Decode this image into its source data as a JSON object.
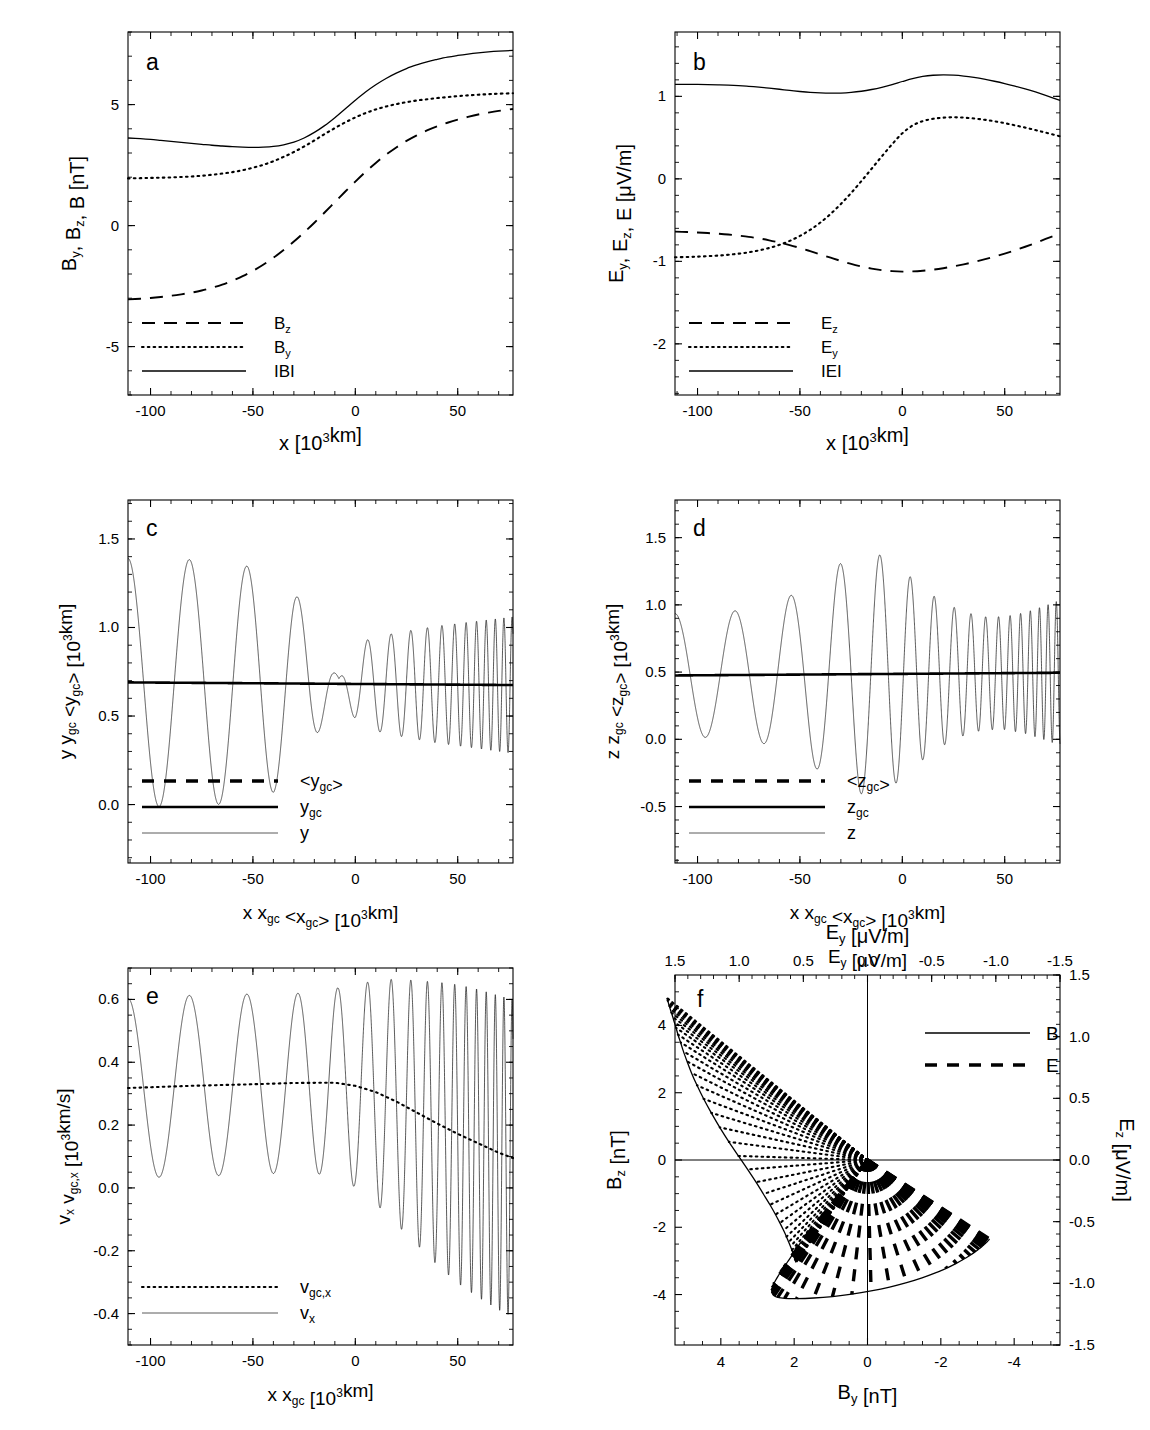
{
  "figure": {
    "title": "",
    "panels": [
      "a",
      "b",
      "c",
      "d",
      "e",
      "f"
    ]
  },
  "chart_data": [
    {
      "id": "a",
      "type": "line",
      "panel_label": "a",
      "title": "",
      "xlabel": "x  [10³km]",
      "ylabel": "Bᵧ, Bᶻ, B  [nT]",
      "xlabel_parts": {
        "main": "x",
        "unit_open": "[10",
        "sup": "3",
        "unit_close": "km]"
      },
      "ylabel_parts": [
        {
          "t": "B",
          "sub": "y"
        },
        {
          "t": ", B",
          "sub": "z"
        },
        {
          "t": ", B  [nT]",
          "sub": ""
        }
      ],
      "xlim": [
        -111,
        77
      ],
      "ylim": [
        -7.0,
        8.0
      ],
      "xticks": [
        -100,
        -50,
        0,
        50
      ],
      "xticklabels": [
        "-100",
        "-50",
        "0",
        "50"
      ],
      "yticks": [
        5,
        0,
        -5
      ],
      "yticklabels": [
        "5",
        "0",
        "-5"
      ],
      "xminor_step": 10,
      "yminor_step": 1,
      "grid": false,
      "legend_position": "lower-left",
      "legend": [
        {
          "label": "B",
          "sub": "z",
          "style": "dashed"
        },
        {
          "label": "B",
          "sub": "y",
          "style": "dotted"
        },
        {
          "label": "IBI",
          "sub": "",
          "style": "solid"
        }
      ],
      "x": [
        -111,
        -105,
        -100,
        -95,
        -90,
        -85,
        -80,
        -75,
        -70,
        -65,
        -60,
        -55,
        -50,
        -45,
        -40,
        -35,
        -30,
        -25,
        -20,
        -15,
        -10,
        -5,
        0,
        5,
        10,
        15,
        20,
        25,
        30,
        35,
        40,
        45,
        50,
        55,
        60,
        65,
        70,
        77
      ],
      "series": [
        {
          "name": "Bz",
          "style": "dashed",
          "values": [
            -3.05,
            -3.02,
            -2.99,
            -2.95,
            -2.9,
            -2.84,
            -2.77,
            -2.68,
            -2.57,
            -2.44,
            -2.28,
            -2.09,
            -1.87,
            -1.62,
            -1.33,
            -1.01,
            -0.66,
            -0.28,
            0.12,
            0.54,
            0.97,
            1.4,
            1.82,
            2.22,
            2.59,
            2.93,
            3.23,
            3.5,
            3.73,
            3.93,
            4.1,
            4.25,
            4.38,
            4.49,
            4.59,
            4.67,
            4.74,
            4.82
          ]
        },
        {
          "name": "By",
          "style": "dotted",
          "values": [
            1.95,
            1.96,
            1.97,
            1.98,
            1.99,
            2.01,
            2.03,
            2.06,
            2.1,
            2.15,
            2.21,
            2.29,
            2.39,
            2.51,
            2.66,
            2.84,
            3.04,
            3.27,
            3.52,
            3.78,
            4.03,
            4.26,
            4.47,
            4.65,
            4.8,
            4.92,
            5.02,
            5.1,
            5.17,
            5.22,
            5.27,
            5.31,
            5.35,
            5.38,
            5.41,
            5.43,
            5.45,
            5.47
          ]
        },
        {
          "name": "IBI",
          "style": "solid",
          "values": [
            3.62,
            3.59,
            3.56,
            3.52,
            3.48,
            3.44,
            3.4,
            3.36,
            3.32,
            3.29,
            3.26,
            3.24,
            3.23,
            3.24,
            3.27,
            3.34,
            3.45,
            3.62,
            3.85,
            4.13,
            4.46,
            4.82,
            5.18,
            5.52,
            5.82,
            6.08,
            6.3,
            6.49,
            6.64,
            6.77,
            6.87,
            6.96,
            7.03,
            7.09,
            7.14,
            7.18,
            7.21,
            7.24
          ]
        }
      ]
    },
    {
      "id": "b",
      "type": "line",
      "panel_label": "b",
      "title": "",
      "xlabel": "x  [10³km]",
      "ylabel": "Eᵧ, Eᶻ, E  [μV/m]",
      "ylabel_parts": [
        {
          "t": "E",
          "sub": "y"
        },
        {
          "t": ", E",
          "sub": "z"
        },
        {
          "t": ", E  [μV/m]",
          "sub": ""
        }
      ],
      "xlim": [
        -111,
        77
      ],
      "ylim": [
        -2.62,
        1.78
      ],
      "xticks": [
        -100,
        -50,
        0,
        50
      ],
      "xticklabels": [
        "-100",
        "-50",
        "0",
        "50"
      ],
      "yticks": [
        1,
        0,
        -1,
        -2
      ],
      "yticklabels": [
        "1",
        "0",
        "-1",
        "-2"
      ],
      "xminor_step": 10,
      "yminor_step": 0.2,
      "grid": false,
      "legend_position": "lower-left",
      "legend": [
        {
          "label": "E",
          "sub": "z",
          "style": "dashed"
        },
        {
          "label": "E",
          "sub": "y",
          "style": "dotted"
        },
        {
          "label": "IEI",
          "sub": "",
          "style": "solid"
        }
      ],
      "x": [
        -111,
        -105,
        -100,
        -95,
        -90,
        -85,
        -80,
        -75,
        -70,
        -65,
        -60,
        -55,
        -50,
        -45,
        -40,
        -35,
        -30,
        -25,
        -20,
        -15,
        -10,
        -5,
        0,
        5,
        10,
        15,
        20,
        25,
        30,
        35,
        40,
        45,
        50,
        55,
        60,
        65,
        70,
        77
      ],
      "series": [
        {
          "name": "Ez",
          "style": "dashed",
          "values": [
            -0.64,
            -0.645,
            -0.65,
            -0.657,
            -0.665,
            -0.675,
            -0.688,
            -0.703,
            -0.722,
            -0.745,
            -0.772,
            -0.803,
            -0.838,
            -0.876,
            -0.916,
            -0.956,
            -0.995,
            -1.031,
            -1.062,
            -1.088,
            -1.107,
            -1.119,
            -1.124,
            -1.122,
            -1.114,
            -1.101,
            -1.083,
            -1.061,
            -1.036,
            -1.008,
            -0.977,
            -0.943,
            -0.906,
            -0.866,
            -0.823,
            -0.777,
            -0.728,
            -0.663
          ]
        },
        {
          "name": "Ey",
          "style": "dotted",
          "values": [
            -0.95,
            -0.947,
            -0.943,
            -0.937,
            -0.93,
            -0.92,
            -0.907,
            -0.89,
            -0.867,
            -0.838,
            -0.8,
            -0.752,
            -0.692,
            -0.618,
            -0.529,
            -0.425,
            -0.305,
            -0.172,
            -0.028,
            0.122,
            0.273,
            0.419,
            0.552,
            0.646,
            0.7,
            0.728,
            0.742,
            0.746,
            0.742,
            0.732,
            0.717,
            0.698,
            0.675,
            0.649,
            0.621,
            0.591,
            0.56,
            0.516
          ]
        },
        {
          "name": "IEI",
          "style": "solid",
          "values": [
            1.146,
            1.146,
            1.145,
            1.143,
            1.14,
            1.136,
            1.13,
            1.122,
            1.112,
            1.1,
            1.086,
            1.072,
            1.059,
            1.048,
            1.041,
            1.038,
            1.04,
            1.048,
            1.062,
            1.083,
            1.11,
            1.143,
            1.18,
            1.215,
            1.241,
            1.256,
            1.261,
            1.257,
            1.246,
            1.229,
            1.208,
            1.183,
            1.155,
            1.124,
            1.09,
            1.053,
            1.012,
            0.95
          ]
        }
      ]
    },
    {
      "id": "c",
      "type": "line",
      "panel_label": "c",
      "title": "",
      "xlabel": "x  x_gc  <x_gc>  [10³km]",
      "ylabel": "y  y_gc  <y_gc>  [10³km]",
      "xlim": [
        -111,
        77
      ],
      "ylim": [
        -0.33,
        1.72
      ],
      "xticks": [
        -100,
        -50,
        0,
        50
      ],
      "xticklabels": [
        "-100",
        "-50",
        "0",
        "50"
      ],
      "yticks": [
        1.5,
        1.0,
        0.5,
        0.0
      ],
      "yticklabels": [
        "1.5",
        "1.0",
        "0.5",
        "0.0"
      ],
      "xminor_step": 10,
      "yminor_step": 0.1,
      "grid": false,
      "legend_position": "lower-left",
      "legend": [
        {
          "label": "<y",
          "sub": "gc",
          "suffix": ">",
          "style": "dashedthick"
        },
        {
          "label": "y",
          "sub": "gc",
          "suffix": "",
          "style": "thick"
        },
        {
          "label": "y",
          "sub": "",
          "suffix": "",
          "style": "thin"
        }
      ],
      "oscillation": {
        "mean_start": 0.69,
        "mean_end": 0.675,
        "amp_nodes_x": [
          -111,
          -100,
          -90,
          -80,
          -70,
          -60,
          -50,
          -40,
          -30,
          -22,
          -16,
          -11,
          -8,
          -5,
          0,
          6,
          12,
          20,
          30,
          40,
          50,
          60,
          70,
          77
        ],
        "amp_nodes_y": [
          0.7,
          0.7,
          0.7,
          0.695,
          0.69,
          0.675,
          0.655,
          0.615,
          0.52,
          0.38,
          0.22,
          0.09,
          0.03,
          0.1,
          0.2,
          0.25,
          0.27,
          0.29,
          0.31,
          0.33,
          0.345,
          0.36,
          0.375,
          0.385
        ],
        "phase_rate_nodes_x": [
          -111,
          -80,
          -50,
          -30,
          -10,
          0,
          20,
          40,
          60,
          77
        ],
        "phase_rate_nodes_y": [
          0.205,
          0.215,
          0.235,
          0.27,
          0.36,
          0.44,
          0.62,
          0.9,
          1.3,
          1.62
        ],
        "n_samples": 6000
      }
    },
    {
      "id": "d",
      "type": "line",
      "panel_label": "d",
      "title": "",
      "xlabel": "x  x_gc  <x_gc>  [10³km]",
      "ylabel": "z  z_gc  <z_gc>  [10³km]",
      "xlabel2": "E_y  [μV/m]",
      "xlim": [
        -111,
        77
      ],
      "ylim": [
        -0.92,
        1.78
      ],
      "xticks": [
        -100,
        -50,
        0,
        50
      ],
      "xticklabels": [
        "-100",
        "-50",
        "0",
        "50"
      ],
      "yticks": [
        1.5,
        1.0,
        0.5,
        0.0,
        -0.5
      ],
      "yticklabels": [
        "1.5",
        "1.0",
        "0.5",
        "0.0",
        "-0.5"
      ],
      "xminor_step": 10,
      "yminor_step": 0.1,
      "grid": false,
      "legend_position": "lower-left",
      "legend": [
        {
          "label": "<z",
          "sub": "gc",
          "suffix": ">",
          "style": "dashedthick"
        },
        {
          "label": "z",
          "sub": "gc",
          "suffix": "",
          "style": "thick"
        },
        {
          "label": "z",
          "sub": "",
          "suffix": "",
          "style": "thin"
        }
      ],
      "oscillation": {
        "mean_start": 0.475,
        "mean_end": 0.495,
        "amp_nodes_x": [
          -111,
          -100,
          -90,
          -80,
          -70,
          -60,
          -50,
          -42,
          -34,
          -26,
          -20,
          -14,
          -8,
          -2,
          4,
          10,
          16,
          24,
          32,
          40,
          50,
          60,
          70,
          77
        ],
        "amp_nodes_y": [
          0.46,
          0.46,
          0.465,
          0.48,
          0.5,
          0.55,
          0.62,
          0.7,
          0.79,
          0.86,
          0.89,
          0.9,
          0.87,
          0.8,
          0.72,
          0.64,
          0.57,
          0.5,
          0.45,
          0.42,
          0.42,
          0.45,
          0.5,
          0.54
        ],
        "phase_rate_nodes_x": [
          -111,
          -80,
          -50,
          -30,
          -10,
          0,
          20,
          40,
          60,
          77
        ],
        "phase_rate_nodes_y": [
          0.21,
          0.22,
          0.245,
          0.285,
          0.37,
          0.45,
          0.63,
          0.92,
          1.32,
          1.64
        ],
        "n_samples": 6000
      }
    },
    {
      "id": "e",
      "type": "line",
      "panel_label": "e",
      "title": "",
      "xlabel": "x  x_gc  [10³km]",
      "ylabel": "v_x  v_gc,x  [10³km/s]",
      "xlim": [
        -111,
        77
      ],
      "ylim": [
        -0.5,
        0.7
      ],
      "xticks": [
        -100,
        -50,
        0,
        50
      ],
      "xticklabels": [
        "-100",
        "-50",
        "0",
        "50"
      ],
      "yticks": [
        0.6,
        0.4,
        0.2,
        0.0,
        -0.2,
        -0.4
      ],
      "yticklabels": [
        "0.6",
        "0.4",
        "0.2",
        "0.0",
        "-0.2",
        "-0.4"
      ],
      "xminor_step": 10,
      "yminor_step": 0.05,
      "grid": false,
      "legend_position": "lower-left",
      "legend": [
        {
          "label": "v",
          "sub": "gc,x",
          "suffix": "",
          "style": "dotted"
        },
        {
          "label": "v",
          "sub": "x",
          "suffix": "",
          "style": "thin"
        }
      ],
      "oscillation": {
        "mean_nodes_x": [
          -111,
          -80,
          -50,
          -30,
          -10,
          0,
          10,
          20,
          30,
          40,
          50,
          60,
          70,
          77
        ],
        "mean_nodes_y": [
          0.318,
          0.325,
          0.33,
          0.334,
          0.335,
          0.325,
          0.305,
          0.275,
          0.24,
          0.205,
          0.172,
          0.142,
          0.112,
          0.095
        ],
        "amp_nodes_x": [
          -111,
          -100,
          -90,
          -80,
          -70,
          -60,
          -50,
          -40,
          -30,
          -20,
          -10,
          0,
          10,
          20,
          30,
          40,
          50,
          60,
          70,
          77
        ],
        "amp_nodes_y": [
          0.285,
          0.287,
          0.288,
          0.288,
          0.288,
          0.288,
          0.287,
          0.286,
          0.285,
          0.288,
          0.3,
          0.322,
          0.355,
          0.39,
          0.42,
          0.45,
          0.475,
          0.49,
          0.5,
          0.505
        ],
        "phase_rate_nodes_x": [
          -111,
          -80,
          -50,
          -30,
          -10,
          0,
          20,
          40,
          60,
          77
        ],
        "phase_rate_nodes_y": [
          0.205,
          0.215,
          0.235,
          0.27,
          0.36,
          0.44,
          0.62,
          0.9,
          1.3,
          1.62
        ],
        "n_samples": 6000
      }
    },
    {
      "id": "f",
      "type": "scatter",
      "panel_label": "f",
      "title": "",
      "xlabel": "B_y  [nT]",
      "ylabel": "B_z  [nT]",
      "xlabel_top": "E_y  [μV/m]",
      "ylabel_right": "E_z  [μV/m]",
      "xlim": [
        5.25,
        -5.25
      ],
      "ylim": [
        -5.5,
        5.5
      ],
      "xticks": [
        4,
        2,
        0,
        -2,
        -4
      ],
      "xticklabels": [
        "4",
        "2",
        "0",
        "-2",
        "-4"
      ],
      "yticks": [
        4,
        2,
        0,
        -2,
        -4
      ],
      "yticklabels": [
        "4",
        "2",
        "0",
        "-2",
        "-4"
      ],
      "xlim_top": [
        1.5,
        -1.5
      ],
      "ylim_right": [
        -1.5,
        1.5
      ],
      "xticks_top": [
        1.5,
        1.0,
        0.5,
        0.0,
        -0.5,
        -1.0,
        -1.5
      ],
      "xticklabels_top": [
        "1.5",
        "1.0",
        "0.5",
        "0.0",
        "-0.5",
        "-1.0",
        "-1.5"
      ],
      "yticks_right": [
        1.5,
        1.0,
        0.5,
        0.0,
        -0.5,
        -1.0,
        -1.5
      ],
      "yticklabels_right": [
        "1.5",
        "1.0",
        "0.5",
        "0.0",
        "-0.5",
        "-1.0",
        "-1.5"
      ],
      "xminor_step": 0.5,
      "yminor_step": 0.5,
      "grid": false,
      "zero_lines": true,
      "legend_position": "upper-right",
      "legend": [
        {
          "label": "B",
          "sub": "",
          "style": "solid"
        },
        {
          "label": "E",
          "sub": "",
          "style": "dashedthick"
        }
      ],
      "hodogram": {
        "n_steps": 38,
        "B_By_start": 1.95,
        "B_By_end": 5.47,
        "B_Bz_start": -3.05,
        "B_Bz_end": 4.82,
        "E_Ey_start": -0.95,
        "E_Ey_end": 0.516,
        "E_Ez_start": -0.64,
        "E_Ez_end": -0.663
      }
    }
  ]
}
